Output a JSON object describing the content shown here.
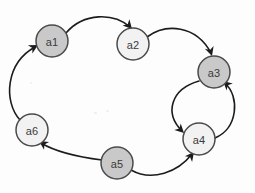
{
  "graph": {
    "title": "Directed cycle graph",
    "background_color": "#fdfdfd",
    "stroke_color": "#1c1c1c",
    "node_stroke_color": "#4a4a4a",
    "node_fill_shaded": "#c9c9c9",
    "node_fill_plain": "#f2f2f2",
    "node_radius": 16,
    "nodes": [
      {
        "id": "a1",
        "label": "a1",
        "cx": 52,
        "cy": 41,
        "shaded": true
      },
      {
        "id": "a2",
        "label": "a2",
        "cx": 133,
        "cy": 44,
        "shaded": false
      },
      {
        "id": "a3",
        "label": "a3",
        "cx": 214,
        "cy": 72,
        "shaded": true
      },
      {
        "id": "a4",
        "label": "a4",
        "cx": 199,
        "cy": 139,
        "shaded": false
      },
      {
        "id": "a5",
        "label": "a5",
        "cx": 117,
        "cy": 163,
        "shaded": true
      },
      {
        "id": "a6",
        "label": "a6",
        "cx": 32,
        "cy": 130,
        "shaded": false
      }
    ],
    "edges": [
      {
        "id": "a1-a2",
        "from": "a1",
        "to": "a2",
        "path": "M 66 33 C 84 12, 114 13, 130 27",
        "arrow": {
          "x": 132,
          "y": 29,
          "angle": 48
        }
      },
      {
        "id": "a2-a3",
        "from": "a2",
        "to": "a3",
        "path": "M 147 37 C 166 23, 196 25, 211 53",
        "arrow": {
          "x": 212,
          "y": 56,
          "angle": 72
        }
      },
      {
        "id": "a3-a4",
        "from": "a3",
        "to": "a4",
        "path": "M 199 81 C 171 89, 164 113, 182 131",
        "arrow": {
          "x": 184,
          "y": 133,
          "angle": 44
        }
      },
      {
        "id": "a4-a3",
        "from": "a4",
        "to": "a3",
        "path": "M 215 138 C 238 128, 240 97, 225 83",
        "arrow": {
          "x": 223,
          "y": 81,
          "angle": 222
        }
      },
      {
        "id": "a5-a4",
        "from": "a5",
        "to": "a4",
        "path": "M 131 170 C 152 182, 178 172, 192 154",
        "arrow": {
          "x": 194,
          "y": 152,
          "angle": 308
        }
      },
      {
        "id": "a5-a6",
        "from": "a5",
        "to": "a6",
        "path": "M 102 160 C 78 157, 56 152, 41 143",
        "arrow": {
          "x": 39,
          "y": 141,
          "angle": 213
        }
      },
      {
        "id": "a6-a1",
        "from": "a6",
        "to": "a1",
        "path": "M 20 120 C 3 101, 6 63, 35 47",
        "arrow": {
          "x": 38,
          "y": 45,
          "angle": 331
        }
      }
    ]
  }
}
